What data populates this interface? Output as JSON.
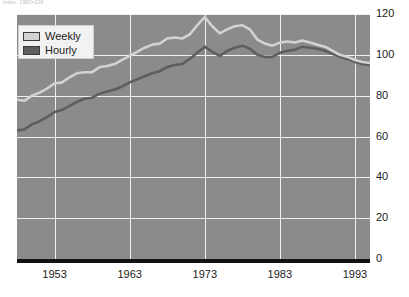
{
  "note": "Index: 1982=100",
  "legend": {
    "position": "top-left",
    "items": [
      {
        "label": "Weekly",
        "color": "#d2d2d2"
      },
      {
        "label": "Hourly",
        "color": "#5e5e5e"
      }
    ]
  },
  "colors": {
    "plot_background": "#8b8b8b",
    "gridline": "#f0f0f0",
    "axis": "#111111",
    "weekly": "#d2d2d2",
    "hourly": "#5e5e5e",
    "tick_text": "#1a1a1a"
  },
  "axes": {
    "y_ticks": [
      "0",
      "20",
      "40",
      "60",
      "80",
      "100",
      "120"
    ],
    "x_ticks": [
      "1953",
      "1963",
      "1973",
      "1983",
      "1993"
    ]
  },
  "chart_data": {
    "type": "line",
    "title": "",
    "subtitle": "",
    "note": "Index: 1982=100",
    "xlabel": "",
    "ylabel": "",
    "xlim": [
      1948,
      1995
    ],
    "ylim": [
      0,
      120
    ],
    "grid": true,
    "legend_position": "top-left",
    "x": [
      1948,
      1949,
      1950,
      1951,
      1952,
      1953,
      1954,
      1955,
      1956,
      1957,
      1958,
      1959,
      1960,
      1961,
      1962,
      1963,
      1964,
      1965,
      1966,
      1967,
      1968,
      1969,
      1970,
      1971,
      1972,
      1973,
      1974,
      1975,
      1976,
      1977,
      1978,
      1979,
      1980,
      1981,
      1982,
      1983,
      1984,
      1985,
      1986,
      1987,
      1988,
      1989,
      1990,
      1991,
      1992,
      1993,
      1994,
      1995
    ],
    "series": [
      {
        "name": "Weekly",
        "color": "#d2d2d2",
        "values": [
          78,
          77.5,
          80,
          81.5,
          83.5,
          86,
          86.5,
          89,
          91,
          91.5,
          91.5,
          94,
          94.5,
          95.5,
          97.5,
          99.5,
          101.5,
          103.5,
          105,
          105.5,
          108,
          108.5,
          108,
          110,
          114.5,
          118.5,
          114,
          110.5,
          112.5,
          114,
          114.5,
          112.5,
          107.5,
          105.5,
          104.5,
          106,
          106.5,
          106,
          107,
          106,
          105,
          104,
          102,
          100,
          99,
          97.5,
          96.5,
          96
        ]
      },
      {
        "name": "Hourly",
        "color": "#5e5e5e",
        "values": [
          63,
          63.5,
          66,
          67.5,
          69.5,
          72,
          73,
          75,
          77,
          78.5,
          79,
          81,
          82,
          83,
          84.5,
          86.5,
          88,
          89.5,
          91,
          92,
          94,
          95,
          95.5,
          98,
          101,
          104,
          101.5,
          99.5,
          102,
          103.5,
          104.5,
          103,
          100,
          99,
          99,
          101,
          102,
          102.5,
          104,
          103.5,
          103,
          102,
          100.5,
          99,
          98,
          96.5,
          95.5,
          95
        ]
      }
    ]
  }
}
